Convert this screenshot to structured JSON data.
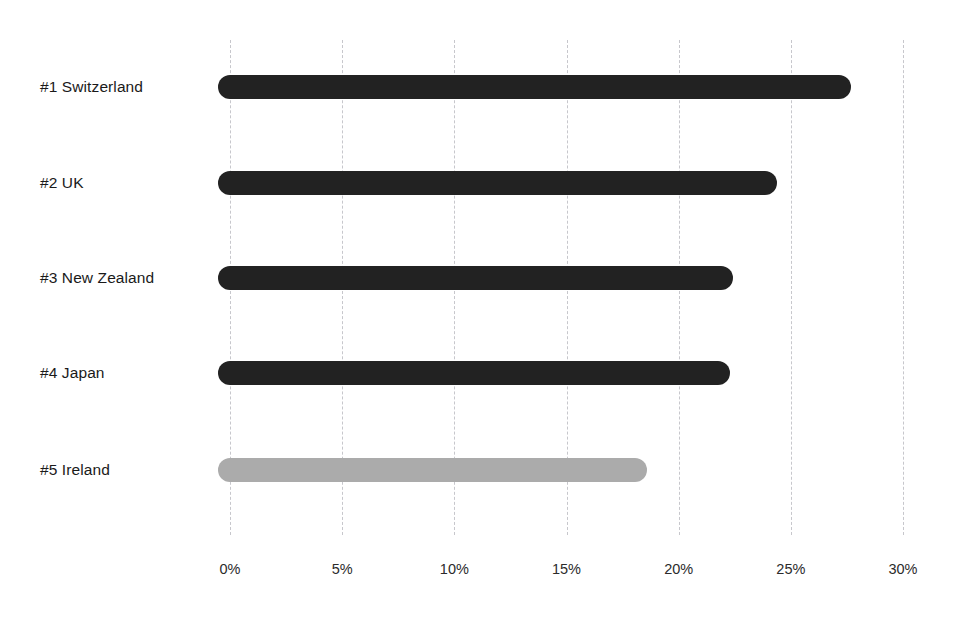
{
  "chart_data": {
    "type": "bar",
    "orientation": "horizontal",
    "title": "",
    "subtitle": "",
    "xlabel": "",
    "ylabel": "",
    "categories": [
      "#1 Switzerland",
      "#2 UK",
      "#3 New Zealand",
      "#4 Japan",
      "#5 Ireland"
    ],
    "values": [
      27.7,
      24.4,
      22.4,
      22.3,
      18.6
    ],
    "value_format": "percent",
    "xlim": [
      0,
      30
    ],
    "tick_values": [
      0,
      5,
      10,
      15,
      20,
      25,
      30
    ],
    "tick_labels": [
      "0%",
      "5%",
      "10%",
      "15%",
      "20%",
      "25%",
      "30%"
    ],
    "grid": true,
    "grid_axis": "x",
    "grid_style": "dashed",
    "legend": false,
    "legend_position": "none",
    "bar_colors": [
      "#222222",
      "#222222",
      "#222222",
      "#222222",
      "#ababab"
    ],
    "highlight_color": "#222222",
    "muted_color": "#ababab",
    "grid_color": "#c7c7cc",
    "background_color": "#ffffff",
    "text_color": "#1a1a1a",
    "bars": [
      {
        "label": "#1 Switzerland",
        "value": 27.7,
        "color": "#222222",
        "muted": false
      },
      {
        "label": "#2 UK",
        "value": 24.4,
        "color": "#222222",
        "muted": false
      },
      {
        "label": "#3 New Zealand",
        "value": 22.4,
        "color": "#222222",
        "muted": false
      },
      {
        "label": "#4 Japan",
        "value": 22.3,
        "color": "#222222",
        "muted": false
      },
      {
        "label": "#5 Ireland",
        "value": 18.6,
        "color": "#ababab",
        "muted": true
      }
    ]
  },
  "layout": {
    "plot_left_px": 230,
    "plot_right_px": 903,
    "grid_top_px": 40,
    "grid_bottom_px": 535,
    "row_centers_px": [
      87,
      183,
      278,
      373,
      470
    ],
    "bar_thickness_px": 24,
    "bar_cap_overhang_px": 12
  }
}
